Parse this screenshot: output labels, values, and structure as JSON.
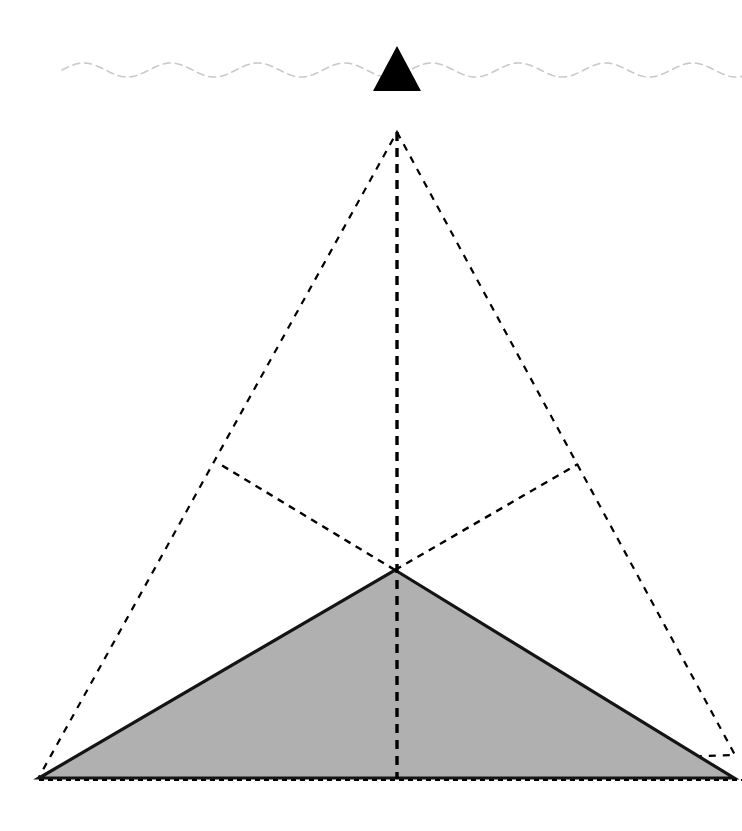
{
  "canvas": {
    "width": 742,
    "height": 831,
    "background": "#ffffff"
  },
  "colors": {
    "stroke_dark": "#000000",
    "fill_gray": "#b0b0b0",
    "wave_gray": "#c9c9c9",
    "edge_solid": "#1a1a1a"
  },
  "diagram": {
    "waterline": {
      "label": "waterline",
      "color": "#c9c9c9",
      "y_center": 70,
      "amplitude": 7,
      "period": 87,
      "x_start": 62,
      "x_end": 742,
      "stroke_width": 1.6,
      "dash": "7 5"
    },
    "visible_peak": {
      "label": "visible-peak",
      "fill": "#000000",
      "apex": {
        "x": 397,
        "y": 46
      },
      "left": {
        "x": 373,
        "y": 91
      },
      "right": {
        "x": 421,
        "y": 91
      }
    },
    "projection_triangle": {
      "label": "projection-outline",
      "stroke": "#000000",
      "stroke_width": 2.2,
      "dash": "7 7",
      "apex": {
        "x": 397,
        "y": 132
      },
      "bottom_left": {
        "x": 39,
        "y": 777
      },
      "bottom_right": {
        "x": 735,
        "y": 755
      }
    },
    "submerged_mass": {
      "label": "submerged-mass",
      "fill": "#b0b0b0",
      "stroke": "#141414",
      "stroke_width": 3.2,
      "apex": {
        "x": 395,
        "y": 570
      },
      "bottom_left": {
        "x": 39,
        "y": 778
      },
      "bottom_right": {
        "x": 734,
        "y": 778
      }
    },
    "axis_line": {
      "label": "central-axis",
      "stroke": "#000000",
      "stroke_width": 3.4,
      "dash": "9 7",
      "top": {
        "x": 397,
        "y": 132
      },
      "bottom": {
        "x": 397,
        "y": 779
      }
    },
    "ray_left": {
      "label": "ray-left",
      "stroke": "#000000",
      "stroke_width": 2.4,
      "dash": "7 6",
      "from": {
        "x": 395,
        "y": 570
      },
      "to": {
        "x": 218,
        "y": 463
      }
    },
    "ray_right": {
      "label": "ray-right",
      "stroke": "#000000",
      "stroke_width": 2.4,
      "dash": "7 6",
      "from": {
        "x": 395,
        "y": 570
      },
      "to": {
        "x": 578,
        "y": 464
      }
    },
    "baseline": {
      "label": "baseline",
      "stroke": "#000000",
      "stroke_width": 1.8,
      "dash": "5 4",
      "from": {
        "x": 39,
        "y": 780
      },
      "to": {
        "x": 742,
        "y": 780
      }
    }
  }
}
